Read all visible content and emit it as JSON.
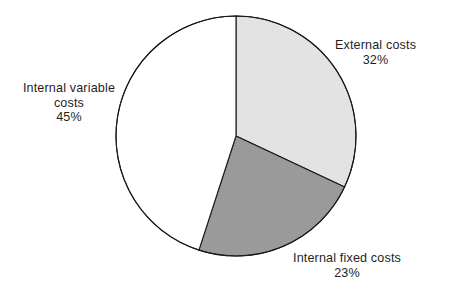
{
  "chart_data": {
    "type": "pie",
    "title": "",
    "subtitle": "",
    "xlabel": "",
    "ylabel": "",
    "legend_position": "none",
    "grid": false,
    "total_percent": 100,
    "start_angle_deg": 0,
    "direction": "clockwise",
    "categories": [
      "External costs",
      "Internal fixed costs",
      "Internal variable costs"
    ],
    "values": [
      32,
      23,
      45
    ],
    "slices": [
      {
        "label": "External costs",
        "value": 32,
        "value_text": "32%",
        "color": "#e3e3e3",
        "stroke": "#1a1a1a",
        "start_deg": 0,
        "end_deg": 115.2,
        "label_position": "right"
      },
      {
        "label": "Internal fixed costs",
        "value": 23,
        "value_text": "23%",
        "color": "#9a9a9a",
        "stroke": "#1a1a1a",
        "start_deg": 115.2,
        "end_deg": 198.0,
        "label_position": "bottom"
      },
      {
        "label": "Internal variable costs",
        "value": 45,
        "value_text": "45%",
        "color": "#ffffff",
        "stroke": "#1a1a1a",
        "start_deg": 198.0,
        "end_deg": 360.0,
        "label_position": "left"
      }
    ]
  },
  "labels": {
    "external": {
      "line1": "External costs",
      "value": "32%"
    },
    "internal_variable": {
      "line1": "Internal variable",
      "line2": "costs",
      "value": "45%"
    },
    "internal_fixed": {
      "line1": "Internal fixed costs",
      "value": "23%"
    }
  },
  "geometry": {
    "center_x": 236,
    "center_y": 136,
    "radius": 120
  },
  "colors": {
    "external_slice": "#e3e3e3",
    "internal_fixed_slice": "#9a9a9a",
    "internal_variable_slice": "#ffffff",
    "outline": "#1a1a1a",
    "text": "#1f1f1f",
    "background": "#ffffff"
  }
}
